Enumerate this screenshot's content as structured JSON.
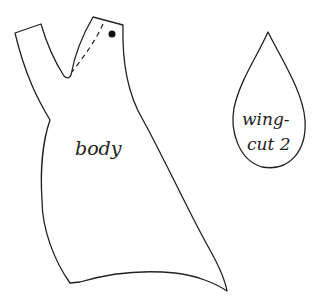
{
  "pattern": {
    "body": {
      "label": "body"
    },
    "wing": {
      "label_line1": "wing-",
      "label_line2": "cut 2"
    }
  },
  "colors": {
    "line": "#222222",
    "background": "#ffffff"
  }
}
